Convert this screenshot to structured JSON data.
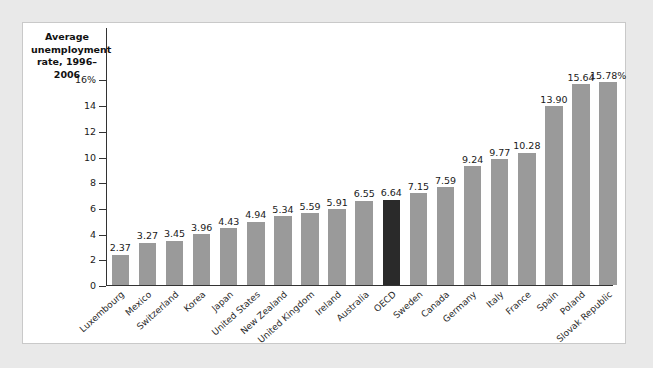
{
  "chart_data": {
    "type": "bar",
    "title": "Average unemployment rate, 1996–2006",
    "title_lines": [
      "Average",
      "unemployment",
      "rate, 1996–2006"
    ],
    "xlabel": "",
    "ylabel": "Average unemployment rate, 1996–2006",
    "ylim": [
      0,
      17
    ],
    "yticks": [
      0,
      2,
      4,
      6,
      8,
      10,
      12,
      14,
      16
    ],
    "ytick_labels": [
      "0",
      "2",
      "4",
      "6",
      "8",
      "10",
      "12",
      "14",
      "16%"
    ],
    "grid": false,
    "legend": "none",
    "bar_color": "#9a9a9a",
    "highlight_color": "#2a2a2a",
    "highlight_category": "OECD",
    "categories": [
      "Luxembourg",
      "Mexico",
      "Switzerland",
      "Korea",
      "Japan",
      "United States",
      "New Zealand",
      "United Kingdom",
      "Ireland",
      "Australia",
      "OECD",
      "Sweden",
      "Canada",
      "Germany",
      "Italy",
      "France",
      "Spain",
      "Poland",
      "Slovak Republic"
    ],
    "values": [
      2.37,
      3.27,
      3.45,
      3.96,
      4.43,
      4.94,
      5.34,
      5.59,
      5.91,
      6.55,
      6.64,
      7.15,
      7.59,
      9.24,
      9.77,
      10.28,
      13.9,
      15.64,
      15.78
    ],
    "value_labels": [
      "2.37",
      "3.27",
      "3.45",
      "3.96",
      "4.43",
      "4.94",
      "5.34",
      "5.59",
      "5.91",
      "6.55",
      "6.64",
      "7.15",
      "7.59",
      "9.24",
      "9.77",
      "10.28",
      "13.90",
      "15.64",
      "15.78%"
    ]
  }
}
